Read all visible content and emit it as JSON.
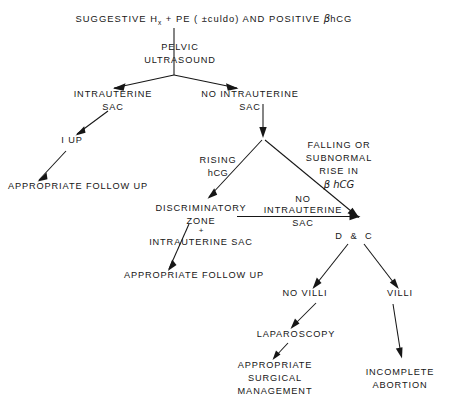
{
  "diagram": {
    "type": "clinical-decision-flowchart",
    "canvas": {
      "width": 471,
      "height": 406
    },
    "nodes": [
      {
        "id": "root",
        "name": "suggestive-history-node",
        "lines": [
          "SUGGESTIVE H + PE ( ±culdo) AND POSITIVE βhCG"
        ],
        "segments": [
          {
            "t": "SUGGESTIVE H",
            "style": "plain"
          },
          {
            "t": "x",
            "style": "sub"
          },
          {
            "t": " + PE ( ±culdo) AND POSITIVE ",
            "style": "plain"
          },
          {
            "t": "β",
            "style": "beta"
          },
          {
            "t": "hCG",
            "style": "plain"
          }
        ],
        "x": 214,
        "y": 22,
        "anchor": "middle"
      },
      {
        "id": "pelvic-us",
        "name": "pelvic-ultrasound-node",
        "lines": [
          "PELVIC",
          "ULTRASOUND"
        ],
        "x": 180,
        "y": 50,
        "anchor": "start"
      },
      {
        "id": "iu-sac",
        "name": "intrauterine-sac-node",
        "lines": [
          "INTRAUTERINE",
          "SAC"
        ],
        "x": 113,
        "y": 97,
        "anchor": "middle"
      },
      {
        "id": "no-iu-sac",
        "name": "no-intrauterine-sac-node",
        "lines": [
          "NO INTRAUTERINE",
          "SAC"
        ],
        "x": 250,
        "y": 97,
        "anchor": "middle"
      },
      {
        "id": "iup",
        "name": "iup-node",
        "lines": [
          "I UP"
        ],
        "x": 72,
        "y": 143,
        "anchor": "middle"
      },
      {
        "id": "followup-1",
        "name": "appropriate-follow-up-node-1",
        "lines": [
          "APPROPRIATE FOLLOW UP"
        ],
        "x": 78,
        "y": 189,
        "anchor": "middle"
      },
      {
        "id": "rising-hcg",
        "name": "rising-hcg-label",
        "lines": [
          "RISING",
          "hCG"
        ],
        "x": 218,
        "y": 163,
        "anchor": "middle"
      },
      {
        "id": "falling-hcg",
        "name": "falling-or-subnormal-rise-label",
        "lines": [
          "FALLING OR",
          "SUBNORMAL",
          "RISE  IN",
          "β hCG"
        ],
        "x": 339,
        "y": 148,
        "anchor": "middle"
      },
      {
        "id": "disc-zone",
        "name": "discriminatory-zone-node",
        "lines": [
          "DISCRIMINATORY",
          "ZONE",
          "+",
          "INTRAUTERINE SAC"
        ],
        "x": 201,
        "y": 211,
        "anchor": "middle"
      },
      {
        "id": "no-iu-sac-2",
        "name": "no-intrauterine-sac-label-2",
        "lines": [
          "NO",
          "INTRAUTERINE",
          "SAC"
        ],
        "x": 303,
        "y": 202,
        "anchor": "middle"
      },
      {
        "id": "dc",
        "name": "dilation-and-curettage-node",
        "lines": [
          "D & C"
        ],
        "x": 355,
        "y": 239,
        "anchor": "middle"
      },
      {
        "id": "followup-2",
        "name": "appropriate-follow-up-node-2",
        "lines": [
          "APPROPRIATE FOLLOW UP"
        ],
        "x": 194,
        "y": 278,
        "anchor": "middle"
      },
      {
        "id": "no-villi",
        "name": "no-villi-node",
        "lines": [
          "NO VILLI"
        ],
        "x": 305,
        "y": 296,
        "anchor": "middle"
      },
      {
        "id": "villi",
        "name": "villi-node",
        "lines": [
          "VILLI"
        ],
        "x": 400,
        "y": 296,
        "anchor": "middle"
      },
      {
        "id": "laparoscopy",
        "name": "laparoscopy-node",
        "lines": [
          "LAPAROSCOPY"
        ],
        "x": 296,
        "y": 337,
        "anchor": "middle"
      },
      {
        "id": "surgical",
        "name": "appropriate-surgical-management-node",
        "lines": [
          "APPROPRIATE",
          "SURGICAL",
          "MANAGEMENT"
        ],
        "x": 275,
        "y": 368,
        "anchor": "middle"
      },
      {
        "id": "incomplete-abortion",
        "name": "incomplete-abortion-node",
        "lines": [
          "INCOMPLETE",
          "ABORTION"
        ],
        "x": 400,
        "y": 375,
        "anchor": "middle"
      }
    ],
    "edges": [
      {
        "name": "edge-root-to-pelvic-us",
        "from": "root",
        "to": "pelvic-us",
        "kind": "line",
        "path": "M 174 28 L 174 75",
        "head": null
      },
      {
        "name": "edge-pelvic-us-to-iu-sac",
        "from": "pelvic-us",
        "to": "iu-sac",
        "kind": "arrow",
        "path": "M 174 75 L 113 88",
        "head": "113,88"
      },
      {
        "name": "edge-pelvic-us-to-no-iu-sac",
        "from": "pelvic-us",
        "to": "no-iu-sac",
        "kind": "arrow",
        "path": "M 174 75 L 238 88",
        "head": "238,88"
      },
      {
        "name": "edge-iu-sac-to-iup",
        "from": "iu-sac",
        "to": "iup",
        "kind": "arrow",
        "path": "M 108 110 L 76 135",
        "head": "76,135"
      },
      {
        "name": "edge-iup-to-followup-1",
        "from": "iup",
        "to": "followup-1",
        "kind": "arrow",
        "path": "M 66 150 L 38 181",
        "head": "38,181"
      },
      {
        "name": "edge-no-iu-sac-down",
        "from": "no-iu-sac",
        "to": "split",
        "kind": "arrow",
        "path": "M 263 104 L 263 137",
        "head": "263,137"
      },
      {
        "name": "edge-split-to-disc-zone",
        "from": "split",
        "to": "disc-zone",
        "kind": "arrow",
        "path": "M 263 137 L 208 198",
        "head": "208,198"
      },
      {
        "name": "edge-split-to-dc",
        "from": "split",
        "to": "dc",
        "kind": "arrow",
        "path": "M 263 137 L 358 218",
        "head": "358,218"
      },
      {
        "name": "edge-disc-zone-to-dc",
        "from": "disc-zone",
        "to": "dc",
        "kind": "arrow",
        "path": "M 237 216 L 360 216",
        "head": "360,216"
      },
      {
        "name": "edge-disc-zone-to-followup-2",
        "from": "disc-zone",
        "to": "followup-2",
        "kind": "arrow",
        "path": "M 188 224 L 168 270",
        "head": "168,270"
      },
      {
        "name": "edge-dc-to-no-villi",
        "from": "dc",
        "to": "no-villi",
        "kind": "arrow",
        "path": "M 348 243 L 313 288",
        "head": "313,288"
      },
      {
        "name": "edge-dc-to-villi",
        "from": "dc",
        "to": "villi",
        "kind": "arrow",
        "path": "M 364 243 L 398 288",
        "head": "398,288"
      },
      {
        "name": "edge-no-villi-to-laparoscopy",
        "from": "no-villi",
        "to": "laparoscopy",
        "kind": "arrow",
        "path": "M 315 302 L 291 329",
        "head": "291,329"
      },
      {
        "name": "edge-laparoscopy-to-surgical",
        "from": "laparoscopy",
        "to": "surgical",
        "kind": "arrow",
        "path": "M 288 342 L 273 360",
        "head": "273,360"
      },
      {
        "name": "edge-villi-to-incomplete",
        "from": "villi",
        "to": "incomplete-abortion",
        "kind": "arrow",
        "path": "M 394 303 L 402 358",
        "head": "402,358"
      }
    ]
  }
}
